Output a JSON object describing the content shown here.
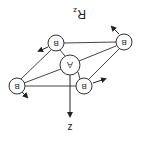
{
  "diagram": {
    "title_label": "R",
    "title_subscript": "z",
    "axis_label": "z",
    "center_atom": {
      "label": "A",
      "x": 70,
      "y": 65,
      "r": 10
    },
    "outer_atoms": [
      {
        "label": "B",
        "x": 124,
        "y": 42,
        "r": 8,
        "arrow": [
          119,
          34,
          111,
          26
        ]
      },
      {
        "label": "B",
        "x": 56,
        "y": 43,
        "r": 8,
        "arrow": [
          48,
          47,
          38,
          51
        ]
      },
      {
        "label": "B",
        "x": 84,
        "y": 86,
        "r": 8,
        "arrow": [
          93,
          83,
          106,
          79
        ]
      },
      {
        "label": "B",
        "x": 17,
        "y": 86,
        "r": 8,
        "arrow": [
          22,
          92,
          28,
          98
        ]
      }
    ],
    "orientation": "rotated 180 degrees",
    "colors": {
      "line": "#333333",
      "background": "#ffffff"
    }
  }
}
